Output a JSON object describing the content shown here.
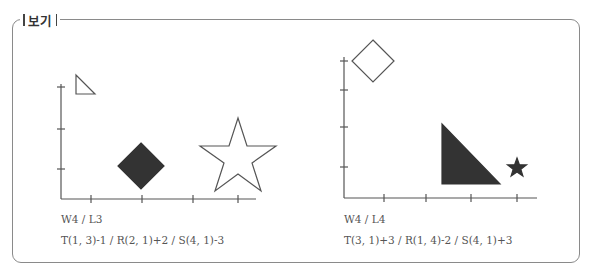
{
  "box": {
    "label": "보기"
  },
  "panels": [
    {
      "id": "left",
      "grid_label": "W4 / L3",
      "transform_label": "T(1, 3)-1 / R(2, 1)+2 / S(4, 1)-3",
      "shapes": [
        {
          "type": "right-triangle",
          "fill": "none",
          "size": "small"
        },
        {
          "type": "diamond",
          "fill": "#333333",
          "size": "medium"
        },
        {
          "type": "star",
          "fill": "none",
          "size": "large"
        }
      ]
    },
    {
      "id": "right",
      "grid_label": "W4 / L4",
      "transform_label": "T(3, 1)+3 / R(1, 4)-2 / S(4, 1)+3",
      "shapes": [
        {
          "type": "right-triangle",
          "fill": "#333333",
          "size": "large"
        },
        {
          "type": "diamond",
          "fill": "none",
          "size": "medium"
        },
        {
          "type": "star",
          "fill": "#333333",
          "size": "small"
        }
      ]
    }
  ],
  "colors": {
    "stroke": "#555555",
    "fill_dark": "#333333",
    "border": "#8a8a8a"
  }
}
